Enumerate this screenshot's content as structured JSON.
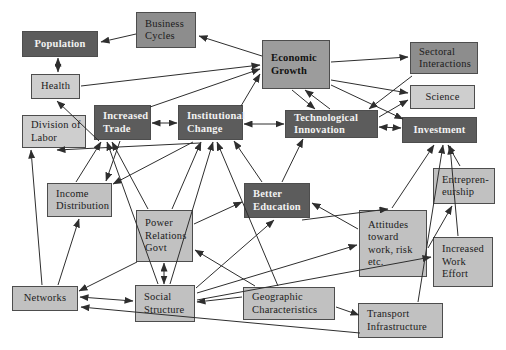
{
  "figure": {
    "description_label": "Economic growth concept diagram",
    "background": "#ffffff",
    "line_color": "#2e2e2e",
    "border_color": "#4d4d4d"
  },
  "diagram": {
    "palette": {
      "dark": "#5c5c5c",
      "middark": "#8d8d8d",
      "mid": "#9c9c9c",
      "lightmid": "#c1c1c1",
      "light": "#cecece"
    },
    "nodes": [
      {
        "id": "population",
        "label": "Population",
        "lines": [
          "Population"
        ],
        "x": 22,
        "y": 31,
        "w": 76,
        "h": 26,
        "shade": "dark",
        "align": "center"
      },
      {
        "id": "business-cycles",
        "label": "Business Cycles",
        "lines": [
          "Business",
          "Cycles"
        ],
        "x": 136,
        "y": 12,
        "w": 60,
        "h": 36,
        "shade": "middark",
        "align": "left"
      },
      {
        "id": "economic-growth",
        "label": "Economic Growth",
        "lines": [
          "Economic",
          "Growth"
        ],
        "x": 262,
        "y": 40,
        "w": 68,
        "h": 49,
        "shade": "mid",
        "align": "left"
      },
      {
        "id": "sectoral-interactions",
        "label": "Sectoral Interactions",
        "lines": [
          "Sectoral",
          "Interactions"
        ],
        "x": 410,
        "y": 42,
        "w": 68,
        "h": 32,
        "shade": "middark",
        "align": "left"
      },
      {
        "id": "science",
        "label": "Science",
        "lines": [
          "Science"
        ],
        "x": 410,
        "y": 85,
        "w": 65,
        "h": 24,
        "shade": "light",
        "align": "center"
      },
      {
        "id": "health",
        "label": "Health",
        "lines": [
          "Health"
        ],
        "x": 31,
        "y": 74,
        "w": 49,
        "h": 25,
        "shade": "light",
        "align": "center"
      },
      {
        "id": "division-of-labor",
        "label": "Division of Labor",
        "lines": [
          "Division of",
          "Labor"
        ],
        "x": 22,
        "y": 115,
        "w": 64,
        "h": 33,
        "shade": "light",
        "align": "left"
      },
      {
        "id": "increased-trade",
        "label": "Increased Trade",
        "lines": [
          "Increased",
          "Trade"
        ],
        "x": 94,
        "y": 105,
        "w": 57,
        "h": 35,
        "shade": "dark",
        "align": "left"
      },
      {
        "id": "institutional-change",
        "label": "Institutional Change",
        "lines": [
          "Institutional",
          "Change"
        ],
        "x": 178,
        "y": 105,
        "w": 65,
        "h": 35,
        "shade": "dark",
        "align": "left"
      },
      {
        "id": "technological-innovation",
        "label": "Technological Innovation",
        "lines": [
          "Technological",
          "Innovation"
        ],
        "x": 285,
        "y": 110,
        "w": 93,
        "h": 28,
        "shade": "dark",
        "align": "left"
      },
      {
        "id": "investment",
        "label": "Investment",
        "lines": [
          "Investment"
        ],
        "x": 402,
        "y": 117,
        "w": 75,
        "h": 26,
        "shade": "dark",
        "align": "center"
      },
      {
        "id": "income-distribution",
        "label": "Income Distribution",
        "lines": [
          "Income",
          "Distribution"
        ],
        "x": 47,
        "y": 183,
        "w": 65,
        "h": 34,
        "shade": "lightmid",
        "align": "left"
      },
      {
        "id": "better-education",
        "label": "Better Education",
        "lines": [
          "Better",
          "Education"
        ],
        "x": 244,
        "y": 183,
        "w": 66,
        "h": 35,
        "shade": "dark",
        "align": "left"
      },
      {
        "id": "power-relations-govt",
        "label": "Power Relations Govt",
        "lines": [
          "Power",
          "Relations",
          "Govt"
        ],
        "x": 136,
        "y": 210,
        "w": 57,
        "h": 52,
        "shade": "lightmid",
        "align": "left"
      },
      {
        "id": "attitudes-work-risk",
        "label": "Attitudes toward work, risk etc.",
        "lines": [
          "Attitudes",
          "toward",
          "work, risk",
          "etc."
        ],
        "x": 359,
        "y": 210,
        "w": 68,
        "h": 67,
        "shade": "lightmid",
        "align": "left"
      },
      {
        "id": "entrepreneurship",
        "label": "Entrepreneurship",
        "lines": [
          "Entrepren-",
          "eurship"
        ],
        "x": 433,
        "y": 168,
        "w": 62,
        "h": 36,
        "shade": "lightmid",
        "align": "left"
      },
      {
        "id": "increased-work-effort",
        "label": "Increased Work Effort",
        "lines": [
          "Increased",
          "Work",
          "Effort"
        ],
        "x": 433,
        "y": 237,
        "w": 60,
        "h": 50,
        "shade": "lightmid",
        "align": "left"
      },
      {
        "id": "networks",
        "label": "Networks",
        "lines": [
          "Networks"
        ],
        "x": 12,
        "y": 286,
        "w": 66,
        "h": 25,
        "shade": "lightmid",
        "align": "center"
      },
      {
        "id": "social-structure",
        "label": "Social Structure",
        "lines": [
          "Social",
          "Structure"
        ],
        "x": 135,
        "y": 285,
        "w": 60,
        "h": 37,
        "shade": "lightmid",
        "align": "left"
      },
      {
        "id": "geographic-characteristics",
        "label": "Geographic Characteristics",
        "lines": [
          "Geographic",
          "Characteristics"
        ],
        "x": 243,
        "y": 287,
        "w": 92,
        "h": 33,
        "shade": "lightmid",
        "align": "left"
      },
      {
        "id": "transport-infrastructure",
        "label": "Transport Infrastructure",
        "lines": [
          "Transport",
          "Infrastructure"
        ],
        "x": 358,
        "y": 303,
        "w": 85,
        "h": 35,
        "shade": "lightmid",
        "align": "left"
      }
    ],
    "edges": [
      {
        "from": "business-cycles",
        "to": "population",
        "x1": 136,
        "y1": 34,
        "x2": 101,
        "y2": 42,
        "both": false
      },
      {
        "from": "economic-growth",
        "to": "business-cycles",
        "x1": 262,
        "y1": 56,
        "x2": 199,
        "y2": 36,
        "both": false
      },
      {
        "from": "population",
        "to": "health",
        "x1": 58,
        "y1": 58,
        "x2": 58,
        "y2": 72,
        "both": true
      },
      {
        "from": "health",
        "to": "economic-growth",
        "x1": 81,
        "y1": 86,
        "x2": 260,
        "y2": 65,
        "both": false
      },
      {
        "from": "increased-trade",
        "to": "economic-growth",
        "x1": 150,
        "y1": 107,
        "x2": 260,
        "y2": 69,
        "both": false
      },
      {
        "from": "institutional-change",
        "to": "economic-growth",
        "x1": 241,
        "y1": 106,
        "x2": 260,
        "y2": 74,
        "both": false
      },
      {
        "from": "technological-innovation",
        "to": "economic-growth",
        "x1": 330,
        "y1": 109,
        "x2": 305,
        "y2": 90,
        "both": false
      },
      {
        "from": "economic-growth",
        "to": "technological-innovation",
        "x1": 292,
        "y1": 90,
        "x2": 315,
        "y2": 109,
        "both": false
      },
      {
        "from": "economic-growth",
        "to": "sectoral-interactions",
        "x1": 331,
        "y1": 62,
        "x2": 408,
        "y2": 57,
        "both": false
      },
      {
        "from": "economic-growth",
        "to": "science",
        "x1": 331,
        "y1": 80,
        "x2": 408,
        "y2": 93,
        "both": false
      },
      {
        "from": "technological-innovation",
        "to": "science",
        "x1": 379,
        "y1": 117,
        "x2": 408,
        "y2": 100,
        "both": false
      },
      {
        "from": "sectoral-interactions",
        "to": "technological-innovation",
        "x1": 412,
        "y1": 76,
        "x2": 369,
        "y2": 109,
        "both": false
      },
      {
        "from": "increased-trade",
        "to": "institutional-change",
        "x1": 152,
        "y1": 123,
        "x2": 177,
        "y2": 123,
        "both": true
      },
      {
        "from": "institutional-change",
        "to": "technological-innovation",
        "x1": 244,
        "y1": 124,
        "x2": 284,
        "y2": 124,
        "both": true
      },
      {
        "from": "technological-innovation",
        "to": "investment",
        "x1": 379,
        "y1": 127,
        "x2": 401,
        "y2": 128,
        "both": true
      },
      {
        "from": "economic-growth",
        "to": "investment",
        "x1": 331,
        "y1": 85,
        "x2": 403,
        "y2": 119,
        "both": false
      },
      {
        "from": "networks",
        "to": "division-of-labor",
        "x1": 42,
        "y1": 285,
        "x2": 31,
        "y2": 150,
        "both": false
      },
      {
        "from": "institutional-change",
        "to": "division-of-labor",
        "x1": 200,
        "y1": 143,
        "x2": 57,
        "y2": 150,
        "both": false
      },
      {
        "from": "increased-trade",
        "to": "health",
        "x1": 99,
        "y1": 141,
        "x2": 57,
        "y2": 101,
        "both": false
      },
      {
        "from": "income-distribution",
        "to": "increased-trade",
        "x1": 76,
        "y1": 182,
        "x2": 101,
        "y2": 142,
        "both": false
      },
      {
        "from": "power-relations-govt",
        "to": "increased-trade",
        "x1": 148,
        "y1": 209,
        "x2": 112,
        "y2": 142,
        "both": false
      },
      {
        "from": "power-relations-govt",
        "to": "institutional-change",
        "x1": 172,
        "y1": 209,
        "x2": 201,
        "y2": 142,
        "both": false
      },
      {
        "from": "social-structure",
        "to": "institutional-change",
        "x1": 170,
        "y1": 284,
        "x2": 213,
        "y2": 142,
        "both": false
      },
      {
        "from": "power-relations-govt",
        "to": "social-structure",
        "x1": 164,
        "y1": 263,
        "x2": 164,
        "y2": 284,
        "both": true
      },
      {
        "from": "increased-trade",
        "to": "income-distribution",
        "x1": 120,
        "y1": 141,
        "x2": 106,
        "y2": 181,
        "both": false
      },
      {
        "from": "institutional-change",
        "to": "income-distribution",
        "x1": 193,
        "y1": 142,
        "x2": 113,
        "y2": 184,
        "both": false
      },
      {
        "from": "networks",
        "to": "income-distribution",
        "x1": 58,
        "y1": 285,
        "x2": 79,
        "y2": 219,
        "both": false
      },
      {
        "from": "power-relations-govt",
        "to": "better-education",
        "x1": 194,
        "y1": 224,
        "x2": 242,
        "y2": 202,
        "both": false
      },
      {
        "from": "social-structure",
        "to": "better-education",
        "x1": 196,
        "y1": 288,
        "x2": 274,
        "y2": 220,
        "both": false
      },
      {
        "from": "attitudes-work-risk",
        "to": "better-education",
        "x1": 358,
        "y1": 229,
        "x2": 312,
        "y2": 203,
        "both": false
      },
      {
        "from": "better-education",
        "to": "attitudes-work-risk",
        "x1": 302,
        "y1": 220,
        "x2": 388,
        "y2": 209,
        "both": false
      },
      {
        "from": "better-education",
        "to": "technological-innovation",
        "x1": 282,
        "y1": 182,
        "x2": 303,
        "y2": 139,
        "both": false
      },
      {
        "from": "better-education",
        "to": "institutional-change",
        "x1": 262,
        "y1": 182,
        "x2": 234,
        "y2": 141,
        "both": false
      },
      {
        "from": "social-structure",
        "to": "increased-work-effort",
        "x1": 197,
        "y1": 300,
        "x2": 431,
        "y2": 257,
        "both": false
      },
      {
        "from": "attitudes-work-risk",
        "to": "entrepreneurship",
        "x1": 428,
        "y1": 248,
        "x2": 452,
        "y2": 206,
        "both": false
      },
      {
        "from": "entrepreneurship",
        "to": "investment",
        "x1": 460,
        "y1": 166,
        "x2": 448,
        "y2": 145,
        "both": false
      },
      {
        "from": "attitudes-work-risk",
        "to": "investment",
        "x1": 392,
        "y1": 208,
        "x2": 434,
        "y2": 145,
        "both": false
      },
      {
        "from": "increased-work-effort",
        "to": "investment",
        "x1": 458,
        "y1": 236,
        "x2": 450,
        "y2": 146,
        "both": false
      },
      {
        "from": "geographic-characteristics",
        "to": "transport-infrastructure",
        "x1": 336,
        "y1": 307,
        "x2": 359,
        "y2": 315,
        "both": false
      },
      {
        "from": "transport-infrastructure",
        "to": "networks",
        "x1": 360,
        "y1": 333,
        "x2": 81,
        "y2": 307,
        "both": false
      },
      {
        "from": "networks",
        "to": "social-structure",
        "x1": 80,
        "y1": 297,
        "x2": 133,
        "y2": 301,
        "both": true
      },
      {
        "from": "geographic-characteristics",
        "to": "social-structure",
        "x1": 242,
        "y1": 297,
        "x2": 197,
        "y2": 302,
        "both": false
      },
      {
        "from": "social-structure",
        "to": "attitudes-work-risk",
        "x1": 197,
        "y1": 293,
        "x2": 357,
        "y2": 245,
        "both": false
      },
      {
        "from": "power-relations-govt",
        "to": "networks",
        "x1": 137,
        "y1": 262,
        "x2": 79,
        "y2": 291,
        "both": false
      },
      {
        "from": "geographic-characteristics",
        "to": "institutional-change",
        "x1": 278,
        "y1": 286,
        "x2": 217,
        "y2": 142,
        "both": false
      },
      {
        "from": "geographic-characteristics",
        "to": "power-relations-govt",
        "x1": 255,
        "y1": 286,
        "x2": 195,
        "y2": 250,
        "both": false
      },
      {
        "from": "social-structure",
        "to": "increased-trade",
        "x1": 158,
        "y1": 284,
        "x2": 107,
        "y2": 142,
        "both": false
      },
      {
        "from": "transport-infrastructure",
        "to": "investment",
        "x1": 418,
        "y1": 302,
        "x2": 443,
        "y2": 145,
        "both": false
      }
    ]
  }
}
